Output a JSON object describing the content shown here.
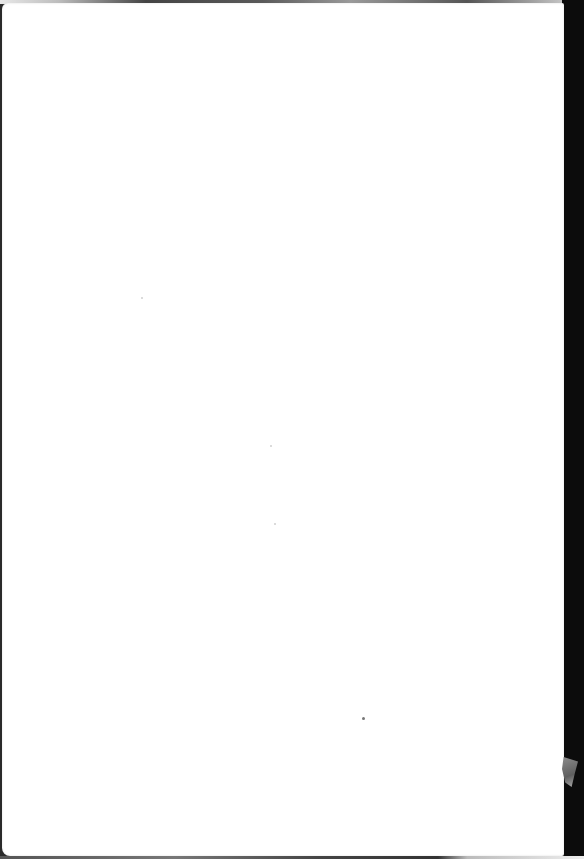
{
  "document": {
    "type": "blank-scanned-page",
    "text": ""
  },
  "colors": {
    "paper": "#ffffff",
    "background": "#0c0c0c"
  }
}
